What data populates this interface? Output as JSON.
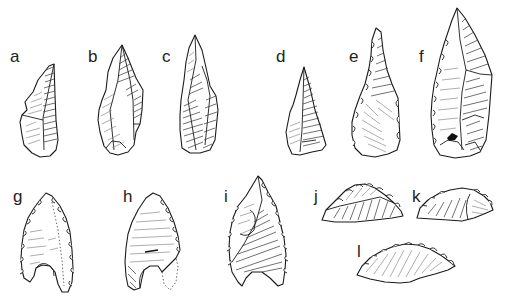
{
  "figure": {
    "artefacts": [
      {
        "id": "a",
        "label": "a",
        "label_pos": [
          10,
          48
        ]
      },
      {
        "id": "b",
        "label": "b",
        "label_pos": [
          88,
          48
        ]
      },
      {
        "id": "c",
        "label": "c",
        "label_pos": [
          162,
          48
        ]
      },
      {
        "id": "d",
        "label": "d",
        "label_pos": [
          276,
          48
        ]
      },
      {
        "id": "e",
        "label": "e",
        "label_pos": [
          349,
          48
        ]
      },
      {
        "id": "f",
        "label": "f",
        "label_pos": [
          419,
          48
        ]
      },
      {
        "id": "g",
        "label": "g",
        "label_pos": [
          13,
          188
        ]
      },
      {
        "id": "h",
        "label": "h",
        "label_pos": [
          123,
          188
        ]
      },
      {
        "id": "i",
        "label": "i",
        "label_pos": [
          224,
          188
        ]
      },
      {
        "id": "j",
        "label": "j",
        "label_pos": [
          314,
          188
        ]
      },
      {
        "id": "k",
        "label": "k",
        "label_pos": [
          412,
          188
        ]
      },
      {
        "id": "l",
        "label": "l",
        "label_pos": [
          357,
          243
        ]
      }
    ]
  }
}
